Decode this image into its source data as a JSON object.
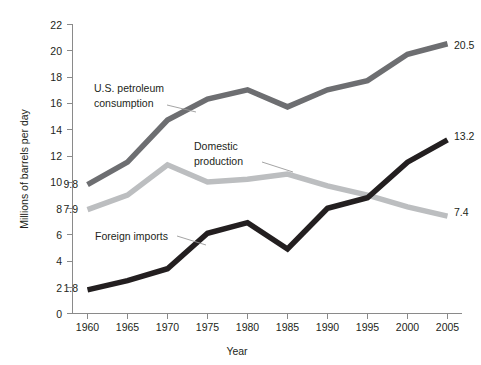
{
  "chart_data": {
    "type": "line",
    "title": "",
    "xlabel": "Year",
    "ylabel": "Millions of barrels per day",
    "x": [
      1960,
      1965,
      1970,
      1975,
      1980,
      1985,
      1990,
      1995,
      2000,
      2005
    ],
    "xtick_labels": [
      "1960",
      "1965",
      "1970",
      "1975",
      "1980",
      "1985",
      "1990",
      "1995",
      "2000",
      "2005"
    ],
    "ytick_labels": [
      "0",
      "2",
      "4",
      "6",
      "8",
      "10",
      "12",
      "14",
      "16",
      "18",
      "20",
      "22"
    ],
    "yticks": [
      0,
      2,
      4,
      6,
      8,
      10,
      12,
      14,
      16,
      18,
      20,
      22
    ],
    "xlim": [
      1960,
      2005
    ],
    "ylim": [
      0,
      22
    ],
    "grid": false,
    "legend_position": "inline-annotations",
    "series": [
      {
        "name": "U.S. petroleum consumption",
        "color": "#6d6e71",
        "values": [
          9.8,
          11.5,
          14.7,
          16.3,
          17.0,
          15.7,
          17.0,
          17.7,
          19.7,
          20.5
        ],
        "start_label": "9.8",
        "end_label": "20.5"
      },
      {
        "name": "Domestic production",
        "color": "#bcbec0",
        "values": [
          7.9,
          9.0,
          11.3,
          10.0,
          10.2,
          10.6,
          9.7,
          9.0,
          8.1,
          7.4
        ],
        "start_label": "7.9",
        "end_label": "7.4"
      },
      {
        "name": "Foreign imports",
        "color": "#231f20",
        "values": [
          1.8,
          2.5,
          3.4,
          6.1,
          6.9,
          4.9,
          8.0,
          8.8,
          11.5,
          13.2
        ],
        "start_label": "1.8",
        "end_label": "13.2"
      }
    ],
    "annotations": [
      {
        "text_line1": "U.S. petroleum",
        "text_line2": "consumption"
      },
      {
        "text_line1": "Domestic",
        "text_line2": "production"
      },
      {
        "text_line1": "Foreign imports",
        "text_line2": ""
      }
    ]
  },
  "axis": {
    "x_title": "Year",
    "y_title": "Millions of barrels per day"
  },
  "labels": {
    "y0": "0",
    "y2": "2",
    "y4": "4",
    "y6": "6",
    "y8": "8",
    "y10": "10",
    "y12": "12",
    "y14": "14",
    "y16": "16",
    "y18": "18",
    "y20": "20",
    "y22": "22",
    "x1960": "1960",
    "x1965": "1965",
    "x1970": "1970",
    "x1975": "1975",
    "x1980": "1980",
    "x1985": "1985",
    "x1990": "1990",
    "x1995": "1995",
    "x2000": "2000",
    "x2005": "2005",
    "consumption_l1": "U.S. petroleum",
    "consumption_l2": "consumption",
    "production_l1": "Domestic",
    "production_l2": "production",
    "imports_l1": "Foreign imports",
    "start_consumption": "9.8",
    "start_production": "7.9",
    "start_imports": "1.8",
    "end_consumption": "20.5",
    "end_production": "7.4",
    "end_imports": "13.2"
  },
  "colors": {
    "consumption": "#6d6e71",
    "production": "#bcbec0",
    "imports": "#231f20",
    "axis": "#8a8a8a",
    "text": "#231f20",
    "background": "#ffffff"
  }
}
